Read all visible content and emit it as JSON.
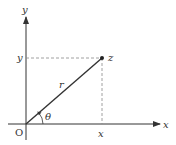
{
  "diagram": {
    "axes": {
      "x_label": "x",
      "y_label": "y",
      "origin_label": "O"
    },
    "point": {
      "label": "z",
      "x_tick_label": "x",
      "y_tick_label": "y"
    },
    "radius_label": "r",
    "angle_label": "θ",
    "colors": {
      "line": "#333333",
      "dashed": "#888888",
      "background": "#ffffff"
    }
  }
}
